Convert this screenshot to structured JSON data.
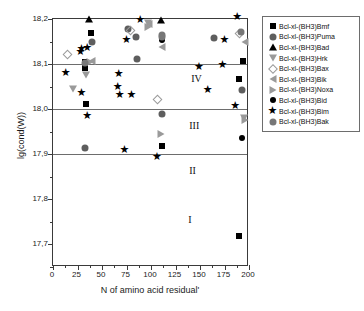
{
  "chart_data": {
    "type": "scatter",
    "title": "",
    "xlabel": "N of amino acid residual'",
    "ylabel": "lg(cond(W))",
    "xlim": [
      0,
      200
    ],
    "ylim": [
      17.65,
      18.2
    ],
    "xticks": [
      0,
      25,
      50,
      75,
      100,
      125,
      150,
      175,
      200
    ],
    "xtick_labels": [
      "0",
      "25",
      "50",
      "75",
      "100",
      "125",
      "150",
      "175",
      "200"
    ],
    "yticks": [
      17.7,
      17.8,
      17.9,
      18.0,
      18.1,
      18.2
    ],
    "ytick_labels": [
      "17,7",
      "17,8",
      "17,9",
      "18,0",
      "18,1",
      "18,2"
    ],
    "grid": false,
    "reference_lines": [
      17.9,
      18.0,
      18.1
    ],
    "legend_position": "right",
    "region_labels": [
      {
        "text": "I",
        "x": 138,
        "y": 17.755
      },
      {
        "text": "II",
        "x": 139,
        "y": 17.862
      },
      {
        "text": "III",
        "x": 139,
        "y": 17.962
      },
      {
        "text": "IV",
        "x": 141,
        "y": 18.068
      }
    ],
    "series": [
      {
        "name": "Bcl-xl-(BH3)Bmf",
        "marker": "square-filled",
        "color": "#000000",
        "points": [
          {
            "x": 33,
            "y": 18.105
          },
          {
            "x": 33,
            "y": 18.092
          },
          {
            "x": 34,
            "y": 18.011
          },
          {
            "x": 39,
            "y": 18.168
          },
          {
            "x": 111,
            "y": 17.918
          },
          {
            "x": 190,
            "y": 18.067
          },
          {
            "x": 190,
            "y": 17.718
          },
          {
            "x": 194,
            "y": 18.106
          }
        ]
      },
      {
        "name": "Bcl-xl-(BH3)Puma",
        "marker": "circle-gray",
        "color": "#5e5e5e",
        "points": [
          {
            "x": 33,
            "y": 17.914
          },
          {
            "x": 40,
            "y": 18.15
          },
          {
            "x": 77,
            "y": 18.178
          },
          {
            "x": 85,
            "y": 18.161
          },
          {
            "x": 86,
            "y": 18.112
          },
          {
            "x": 111,
            "y": 17.99
          },
          {
            "x": 164,
            "y": 18.158
          },
          {
            "x": 193,
            "y": 18.043
          }
        ]
      },
      {
        "name": "Bcl-xl-(BH3)Bad",
        "marker": "triangle-up-filled",
        "color": "#000000",
        "points": [
          {
            "x": 37,
            "y": 18.2
          },
          {
            "x": 110,
            "y": 18.197
          }
        ]
      },
      {
        "name": "Bcl-xl-(BH3)Hrk",
        "marker": "triangle-down-open",
        "color": "#9a9a9a",
        "points": [
          {
            "x": 20,
            "y": 18.044
          },
          {
            "x": 34,
            "y": 18.075
          },
          {
            "x": 97,
            "y": 18.192
          },
          {
            "x": 195,
            "y": 17.98
          }
        ]
      },
      {
        "name": "Bcl-xl-(BH3)Bax",
        "marker": "diamond-open",
        "color": "#9a9a9a",
        "points": [
          {
            "x": 18,
            "y": 18.113
          },
          {
            "x": 83,
            "y": 18.166
          },
          {
            "x": 110,
            "y": 18.013
          },
          {
            "x": 194,
            "y": 18.16
          }
        ]
      },
      {
        "name": "Bcl-xl-(BH3)Bik",
        "marker": "triangle-left-open",
        "color": "#9a9a9a",
        "points": [
          {
            "x": 40,
            "y": 18.107
          },
          {
            "x": 98,
            "y": 18.188
          },
          {
            "x": 111,
            "y": 18.137
          },
          {
            "x": 196,
            "y": 18.148
          }
        ]
      },
      {
        "name": "Bcl-xl-(BH3)Noxa",
        "marker": "triangle-right-open",
        "color": "#9a9a9a",
        "points": [
          {
            "x": 38,
            "y": 18.104
          },
          {
            "x": 97,
            "y": 18.182
          },
          {
            "x": 110,
            "y": 17.944
          },
          {
            "x": 196,
            "y": 17.976
          }
        ]
      },
      {
        "name": "Bcl-xl-(BH3)Bid",
        "marker": "circle-filled",
        "color": "#000000",
        "points": [
          {
            "x": 111,
            "y": 18.154
          },
          {
            "x": 193,
            "y": 17.936
          }
        ]
      },
      {
        "name": "Bcl-xl-(BH3)Bim",
        "marker": "star",
        "color": "#000000",
        "points": [
          {
            "x": 18,
            "y": 18.072
          },
          {
            "x": 33,
            "y": 18.117
          },
          {
            "x": 34,
            "y": 18.125
          },
          {
            "x": 34,
            "y": 18.026
          },
          {
            "x": 40,
            "y": 18.127
          },
          {
            "x": 40,
            "y": 17.977
          },
          {
            "x": 71,
            "y": 18.04
          },
          {
            "x": 72,
            "y": 18.069
          },
          {
            "x": 73,
            "y": 18.022
          },
          {
            "x": 78,
            "y": 17.9
          },
          {
            "x": 80,
            "y": 18.145
          },
          {
            "x": 85,
            "y": 18.022
          },
          {
            "x": 94,
            "y": 18.19
          },
          {
            "x": 111,
            "y": 17.884
          },
          {
            "x": 154,
            "y": 18.084
          },
          {
            "x": 163,
            "y": 18.034
          },
          {
            "x": 178,
            "y": 18.09
          },
          {
            "x": 180,
            "y": 18.144
          },
          {
            "x": 191,
            "y": 17.999
          },
          {
            "x": 193,
            "y": 18.196
          }
        ]
      },
      {
        "name": "Bcl-xl-(BH3)Bak",
        "marker": "circle-lightgray",
        "color": "#777777",
        "points": [
          {
            "x": 33,
            "y": 18.103
          },
          {
            "x": 111,
            "y": 18.165
          },
          {
            "x": 111,
            "y": 18.159
          },
          {
            "x": 192,
            "y": 18.171
          }
        ]
      }
    ]
  },
  "legend": {
    "entries": [
      {
        "label": "Bcl-xl-(BH3)Bmf",
        "marker": "square-filled"
      },
      {
        "label": "Bcl-xl-(BH3)Puma",
        "marker": "circle-gray"
      },
      {
        "label": "Bcl-xl-(BH3)Bad",
        "marker": "triangle-up-filled"
      },
      {
        "label": "Bcl-xl-(BH3)Hrk",
        "marker": "triangle-down-open"
      },
      {
        "label": "Bcl-xl-(BH3)Bax",
        "marker": "diamond-open"
      },
      {
        "label": "Bcl-xl-(BH3)Bik",
        "marker": "triangle-left-open"
      },
      {
        "label": "Bcl-xl-(BH3)Noxa",
        "marker": "triangle-right-open"
      },
      {
        "label": "Bcl-xl-(BH3)Bid",
        "marker": "circle-filled"
      },
      {
        "label": "Bcl-xl-(BH3)Bim",
        "marker": "star"
      },
      {
        "label": "Bcl-xl-(BH3)Bak",
        "marker": "circle-lightgray"
      }
    ]
  }
}
